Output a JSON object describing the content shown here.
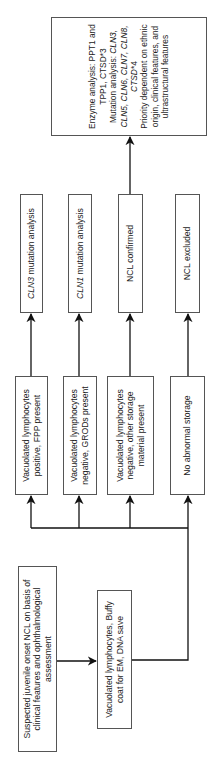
{
  "diagram": {
    "orientation": "rotated-90-ccw",
    "start": {
      "text": "Suspected juvenile onset NCL on basis of clinical features and ophthalmological assessment"
    },
    "sampling": {
      "text": "Vacuolated lymphocytes, Buffy coat for EM, DNA save"
    },
    "branches": [
      {
        "finding": "Vacuolated lymphocytes positive, FPP present",
        "result_prefix_italic": "CLN3",
        "result_suffix": " mutation analysis"
      },
      {
        "finding": "Vacuolated lymphocytes negative, GRODs present",
        "result_prefix_italic": "CLN1",
        "result_suffix": " mutation analysis"
      },
      {
        "finding": "Vacuolated lymphocytes negative, other storage material present",
        "result_prefix_italic": "",
        "result_suffix": "NCL confirmed"
      },
      {
        "finding": "No abnormal storage",
        "result_prefix_italic": "",
        "result_suffix": "NCL excluded"
      }
    ],
    "followup": {
      "line1": "Enzyme analysis: PPT1 and TPP1, CTSD*3",
      "line2_label": "Mutation analysis: ",
      "line2_genes_italic": "CLN3, CLN5, CLN6, CLN7, CLN8, CTSD",
      "line2_suffix": "*4",
      "line3": "Priority dependent on ethnic origin, clinical features, and ultrastructural features"
    },
    "colors": {
      "line": "#111111",
      "box_border": "#555555",
      "text": "#222222"
    }
  }
}
